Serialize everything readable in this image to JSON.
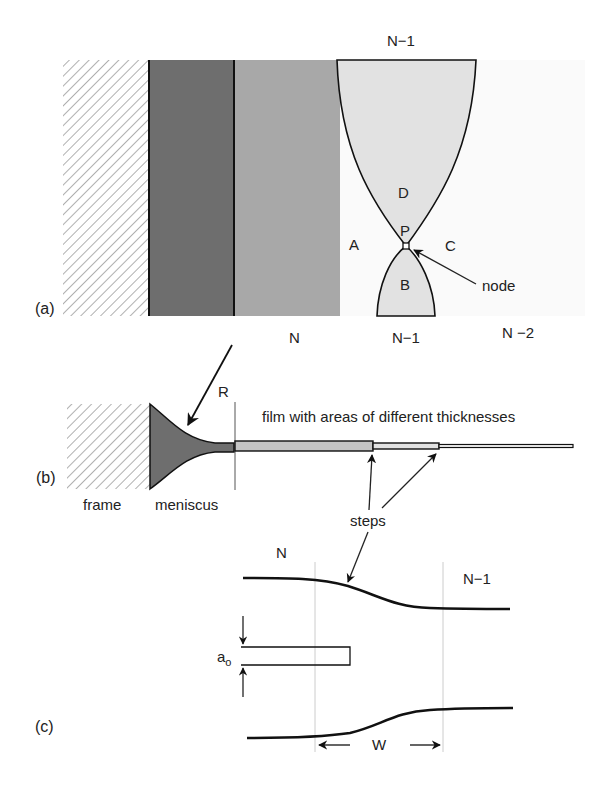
{
  "panels": {
    "a": {
      "label": "(a)",
      "top_label": "N−1",
      "bottom_labels": [
        "N",
        "N−1",
        "N −2"
      ],
      "regions": [
        "A",
        "B",
        "C",
        "D"
      ],
      "node_point": "P",
      "node_label": "node"
    },
    "b": {
      "label": "(b)",
      "radius_label": "R",
      "film_caption": "film with areas of different thicknesses",
      "frame_label": "frame",
      "meniscus_label": "meniscus",
      "steps_label": "steps"
    },
    "c": {
      "label": "(c)",
      "left_label": "N",
      "right_label": "N−1",
      "thickness_label": "a",
      "thickness_subscript": "o",
      "width_label": "W"
    }
  },
  "colors": {
    "frame_hatch": "#b0b0b0",
    "meniscus_dark": "#6e6e6e",
    "film_N": "#a8a8a8",
    "film_N_minus_1": "#e2e2e2",
    "film_N_minus_2": "#fafafa",
    "line": "#111111"
  }
}
